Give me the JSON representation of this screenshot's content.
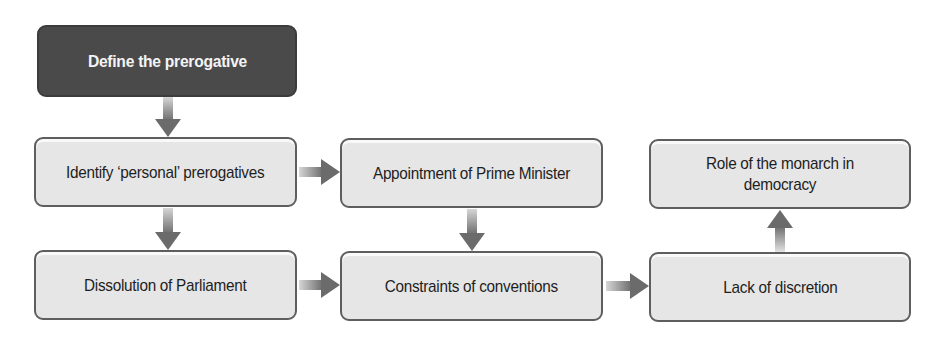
{
  "diagram": {
    "type": "flowchart",
    "colors": {
      "start_node_fill": "#4a4a4a",
      "node_fill": "#e6e6e6",
      "node_border": "#5e5e5e",
      "arrow": "#6b6b6b"
    },
    "nodes": [
      {
        "id": "define",
        "label": "Define the prerogative",
        "style": "dark"
      },
      {
        "id": "identify",
        "label": "Identify ‘personal’ prerogatives"
      },
      {
        "id": "appointment",
        "label": "Appointment of Prime Minister"
      },
      {
        "id": "dissolution",
        "label": "Dissolution of Parliament"
      },
      {
        "id": "constraints",
        "label": "Constraints of conventions"
      },
      {
        "id": "lack",
        "label": "Lack of discretion"
      },
      {
        "id": "role",
        "label": "Role of the monarch in democracy"
      }
    ],
    "edges": [
      {
        "from": "define",
        "to": "identify",
        "direction": "down"
      },
      {
        "from": "identify",
        "to": "appointment",
        "direction": "right"
      },
      {
        "from": "identify",
        "to": "dissolution",
        "direction": "down"
      },
      {
        "from": "appointment",
        "to": "constraints",
        "direction": "down"
      },
      {
        "from": "dissolution",
        "to": "constraints",
        "direction": "right"
      },
      {
        "from": "constraints",
        "to": "lack",
        "direction": "right"
      },
      {
        "from": "lack",
        "to": "role",
        "direction": "up"
      }
    ]
  }
}
